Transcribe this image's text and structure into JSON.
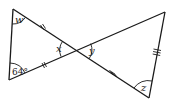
{
  "diagram": {
    "type": "two triangles sharing a vertex (vertically opposite angles)",
    "stroke_color": "#1a1a1a",
    "vertices": {
      "A_top_left": [
        13,
        9
      ],
      "B_bottom_left": [
        9,
        80
      ],
      "O_intersection": [
        76,
        50
      ],
      "C_top_right": [
        165,
        12
      ],
      "D_bottom_right": [
        149,
        98
      ]
    },
    "labels": {
      "w": "w",
      "x": "x",
      "y": "y",
      "z": "z",
      "given_angle": "64°"
    },
    "tick_marks": {
      "left_triangle": "double tick on both sides from top-left and bottom-left to intersection",
      "right_triangle": "triple tick on intersection-to-bottom-right side and right side"
    }
  }
}
